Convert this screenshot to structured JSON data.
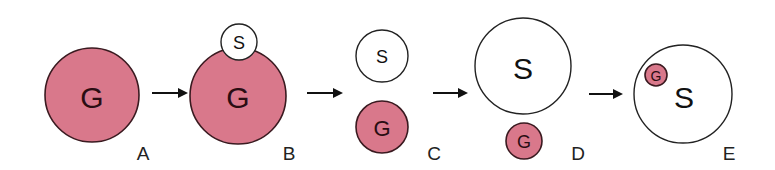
{
  "diagram": {
    "stages": [
      {
        "id": "A",
        "label": "A",
        "g_label": "G"
      },
      {
        "id": "B",
        "label": "B",
        "g_label": "G",
        "s_label": "S"
      },
      {
        "id": "C",
        "label": "C",
        "g_label": "G",
        "s_label": "S"
      },
      {
        "id": "D",
        "label": "D",
        "g_label": "G",
        "s_label": "S"
      },
      {
        "id": "E",
        "label": "E",
        "g_label": "G",
        "s_label": "S"
      }
    ],
    "arrow_count": 4,
    "colors": {
      "g_fill": "#d9788b",
      "g_stroke": "#3a1a20",
      "s_fill": "#ffffff",
      "s_stroke": "#222222"
    }
  }
}
